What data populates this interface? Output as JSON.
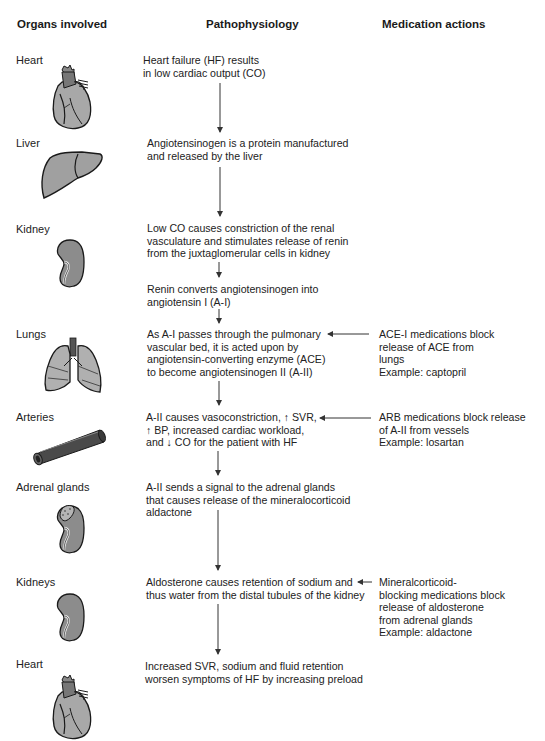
{
  "headers": {
    "organs": "Organs involved",
    "pathophysiology": "Pathophysiology",
    "medications": "Medication actions"
  },
  "rows": [
    {
      "organ": "Heart",
      "icon": "heart-icon",
      "path_lines": [
        "Heart failure (HF) results",
        "in low cardiac output (CO)"
      ]
    },
    {
      "organ": "Liver",
      "icon": "liver-icon",
      "path_lines": [
        "Angiotensinogen is a protein manufactured",
        "and released by the liver"
      ]
    },
    {
      "organ": "Kidney",
      "icon": "kidney-icon",
      "path_lines": [
        "Low CO causes constriction of the renal",
        "vasculature and stimulates release of renin",
        "from the juxtaglomerular cells in kidney"
      ]
    },
    {
      "organ": "",
      "path_lines": [
        "Renin converts angiotensinogen into",
        "angiotensin I (A-I)"
      ]
    },
    {
      "organ": "Lungs",
      "icon": "lungs-icon",
      "path_lines": [
        "As A-I passes through the pulmonary",
        "vascular bed, it is acted upon by",
        "angiotensin-converting enzyme (ACE)",
        "to become angiotensinogen II (A-II)"
      ],
      "med_lines": [
        "ACE-I medications block",
        "release of ACE from",
        "lungs",
        "Example: captopril"
      ]
    },
    {
      "organ": "Arteries",
      "icon": "artery-icon",
      "path_lines": [
        "A-II causes vasoconstriction, ↑ SVR,",
        "↑ BP, increased cardiac workload,",
        "and ↓ CO for the patient with HF"
      ],
      "med_lines": [
        "ARB medications block release",
        "of A-II from vessels",
        "Example: losartan"
      ]
    },
    {
      "organ": "Adrenal glands",
      "icon": "adrenal-kidney-icon",
      "path_lines": [
        "A-II sends a signal to the adrenal glands",
        "that causes release of the mineralocorticoid",
        "aldactone"
      ]
    },
    {
      "organ": "Kidneys",
      "icon": "kidney-icon",
      "path_lines": [
        "Aldosterone causes retention of sodium and",
        "thus water from the distal tubules of the kidney"
      ],
      "med_lines": [
        "Mineralcorticoid-",
        "blocking medications block",
        "release of aldosterone",
        "from adrenal glands",
        "Example: aldactone"
      ]
    },
    {
      "organ": "Heart",
      "icon": "heart-icon",
      "path_lines": [
        "Increased SVR, sodium and fluid retention",
        "worsen symptoms of HF by increasing preload"
      ]
    }
  ],
  "colors": {
    "organ_fill": "#9a9a9a",
    "organ_light": "#b8b8b8",
    "organ_dark": "#555555",
    "outline": "#1a1a1a",
    "arrow": "#333333"
  }
}
